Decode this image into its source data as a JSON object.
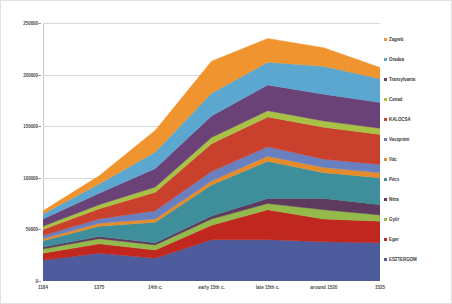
{
  "chart_data": {
    "type": "area",
    "stacked": true,
    "title": "",
    "xlabel": "",
    "ylabel": "",
    "categories": [
      "1184",
      "1375",
      "14th c.",
      "early 15th c.",
      "late 15th c.",
      "around 1520",
      "1525"
    ],
    "ylim": [
      0,
      250000
    ],
    "ytick_labels": [
      "0",
      "50000",
      "100000",
      "150000",
      "200000",
      "250000"
    ],
    "ytick_values": [
      0,
      50000,
      100000,
      150000,
      200000,
      250000
    ],
    "grid": true,
    "legend_position": "right",
    "legend_order": "reversed",
    "series": [
      {
        "name": "ESZTERGOM",
        "color": "#4e5b9c",
        "values": [
          20000,
          27000,
          22000,
          40000,
          40000,
          38000,
          37000
        ]
      },
      {
        "name": "Eger",
        "color": "#c0281f",
        "values": [
          7000,
          9000,
          8000,
          14000,
          29000,
          22000,
          21000
        ]
      },
      {
        "name": "Győr",
        "color": "#93ba4a",
        "values": [
          4000,
          5000,
          5000,
          6000,
          6000,
          9000,
          6000
        ]
      },
      {
        "name": "Nitra",
        "color": "#5d3a5e",
        "values": [
          2000,
          2000,
          2000,
          3000,
          5000,
          11000,
          10000
        ]
      },
      {
        "name": "Pécs",
        "color": "#3e8f9b",
        "values": [
          6000,
          10000,
          20000,
          30000,
          36000,
          25000,
          26000
        ]
      },
      {
        "name": "Vác",
        "color": "#e58b2a",
        "values": [
          2000,
          3000,
          3000,
          4000,
          5000,
          5000,
          5000
        ]
      },
      {
        "name": "Veszprém",
        "color": "#6980c0",
        "values": [
          3000,
          4000,
          8000,
          9000,
          9000,
          8000,
          8000
        ]
      },
      {
        "name": "KALOCSA",
        "color": "#c9402c",
        "values": [
          6000,
          10000,
          18000,
          27000,
          29000,
          31000,
          29000
        ]
      },
      {
        "name": "Cenad",
        "color": "#a8c246",
        "values": [
          3000,
          4000,
          5000,
          6000,
          6000,
          6000,
          6000
        ]
      },
      {
        "name": "Transylvania",
        "color": "#6b4277",
        "values": [
          7000,
          11000,
          18000,
          21000,
          25000,
          26000,
          25000
        ]
      },
      {
        "name": "Oradea",
        "color": "#5ba7cf",
        "values": [
          5000,
          9000,
          16000,
          22000,
          22000,
          27000,
          23000
        ]
      },
      {
        "name": "Zagreb",
        "color": "#f09430",
        "values": [
          3000,
          8000,
          21000,
          31000,
          23000,
          18000,
          11000
        ]
      }
    ],
    "legend_entries": [
      {
        "label": "Zagreb",
        "color": "#f09430"
      },
      {
        "label": "Oradea",
        "color": "#5ba7cf"
      },
      {
        "label": "Transylvania",
        "color": "#6b4277"
      },
      {
        "label": "Cenad",
        "color": "#a8c246"
      },
      {
        "label": "KALOCSA",
        "color": "#c9402c"
      },
      {
        "label": "Veszprém",
        "color": "#6980c0"
      },
      {
        "label": "Vác",
        "color": "#e58b2a"
      },
      {
        "label": "Pécs",
        "color": "#3e8f9b"
      },
      {
        "label": "Nitra",
        "color": "#5d3a5e"
      },
      {
        "label": "Győr",
        "color": "#93ba4a"
      },
      {
        "label": "Eger",
        "color": "#c0281f"
      },
      {
        "label": "ESZTERGOM",
        "color": "#4e5b9c"
      }
    ]
  }
}
